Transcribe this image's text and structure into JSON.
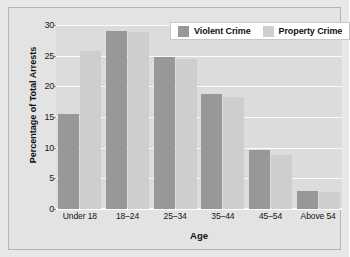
{
  "chart_data": {
    "type": "bar",
    "title": "",
    "xlabel": "Age",
    "ylabel": "Percentage of Total Arrests",
    "categories": [
      "Under 18",
      "18–24",
      "25–34",
      "35–44",
      "45–54",
      "Above 54"
    ],
    "series": [
      {
        "name": "Violent Crime",
        "color": "#989898",
        "values": [
          15.5,
          29.0,
          24.8,
          18.7,
          9.7,
          3.0
        ]
      },
      {
        "name": "Property Crime",
        "color": "#cecece",
        "values": [
          25.7,
          28.8,
          24.5,
          18.2,
          8.8,
          2.7
        ]
      }
    ],
    "ylim": [
      0,
      30
    ],
    "yticks": [
      0,
      5,
      10,
      15,
      20,
      25,
      30
    ],
    "ytick_labels": [
      "0",
      "5",
      "10",
      "15",
      "20",
      "25",
      "30"
    ],
    "grid": true,
    "grid_color": "#fbfbfb",
    "legend_position": "top-right",
    "plot_background": "#dcdcdc",
    "figure_background": "#e3e3e3"
  },
  "legend": {
    "entries": [
      {
        "label": "Violent Crime"
      },
      {
        "label": "Property Crime"
      }
    ]
  }
}
